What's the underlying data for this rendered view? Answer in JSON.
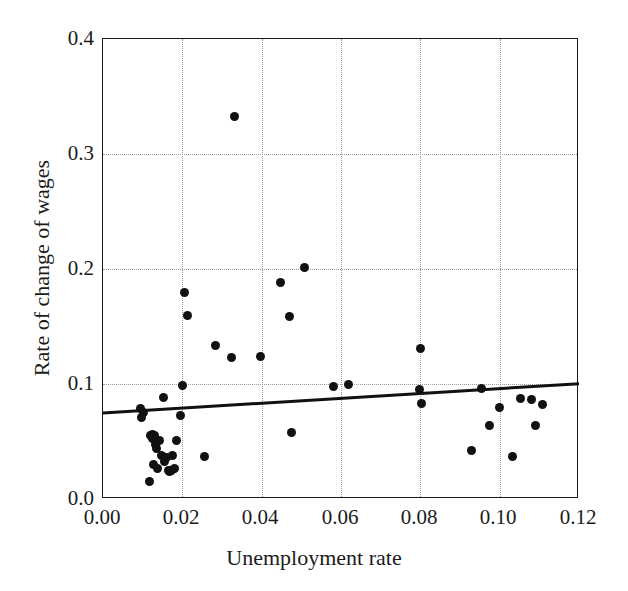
{
  "chart_data": {
    "type": "scatter",
    "title": "",
    "xlabel": "Unemployment rate",
    "ylabel": "Rate of change of wages",
    "xlim": [
      0.0,
      0.12
    ],
    "ylim": [
      0.0,
      0.4
    ],
    "xticks": [
      0.0,
      0.02,
      0.04,
      0.06,
      0.08,
      0.1,
      0.12
    ],
    "yticks": [
      0.0,
      0.1,
      0.2,
      0.3,
      0.4
    ],
    "xticklabels": [
      "0.00",
      "0.02",
      "0.04",
      "0.06",
      "0.08",
      "0.10",
      "0.12"
    ],
    "yticklabels": [
      "0.0",
      "0.1",
      "0.2",
      "0.3",
      "0.4"
    ],
    "grid": true,
    "grid_style": "dotted",
    "grid_color": "#9a9a9a",
    "legend": null,
    "marker_color": "#111111",
    "marker_size_px": 9,
    "series": [
      {
        "name": "observations",
        "points": [
          [
            0.0095,
            0.079
          ],
          [
            0.0098,
            0.0713
          ],
          [
            0.0103,
            0.0752
          ],
          [
            0.0118,
            0.0148
          ],
          [
            0.012,
            0.0553
          ],
          [
            0.0124,
            0.0565
          ],
          [
            0.0126,
            0.053
          ],
          [
            0.0128,
            0.0298
          ],
          [
            0.0131,
            0.0548
          ],
          [
            0.0133,
            0.047
          ],
          [
            0.0136,
            0.0443
          ],
          [
            0.0138,
            0.0265
          ],
          [
            0.0142,
            0.0513
          ],
          [
            0.0147,
            0.0378
          ],
          [
            0.0152,
            0.0885
          ],
          [
            0.0155,
            0.033
          ],
          [
            0.016,
            0.0357
          ],
          [
            0.0164,
            0.0248
          ],
          [
            0.0168,
            0.0243
          ],
          [
            0.0172,
            0.0252
          ],
          [
            0.0176,
            0.0382
          ],
          [
            0.0179,
            0.0265
          ],
          [
            0.0186,
            0.0508
          ],
          [
            0.0196,
            0.0723
          ],
          [
            0.02,
            0.0987
          ],
          [
            0.0205,
            0.1795
          ],
          [
            0.0212,
            0.1597
          ],
          [
            0.0255,
            0.0367
          ],
          [
            0.0283,
            0.1337
          ],
          [
            0.0325,
            0.1232
          ],
          [
            0.0332,
            0.333
          ],
          [
            0.0396,
            0.124
          ],
          [
            0.0448,
            0.188
          ],
          [
            0.047,
            0.159
          ],
          [
            0.0475,
            0.0582
          ],
          [
            0.0508,
            0.201
          ],
          [
            0.058,
            0.0978
          ],
          [
            0.062,
            0.1
          ],
          [
            0.0798,
            0.095
          ],
          [
            0.08,
            0.1305
          ],
          [
            0.0803,
            0.0828
          ],
          [
            0.093,
            0.042
          ],
          [
            0.0955,
            0.0963
          ],
          [
            0.0975,
            0.064
          ],
          [
            0.1,
            0.0795
          ],
          [
            0.1033,
            0.0372
          ],
          [
            0.1052,
            0.0872
          ],
          [
            0.108,
            0.0868
          ],
          [
            0.109,
            0.064
          ],
          [
            0.1108,
            0.082
          ]
        ]
      }
    ],
    "trend_line": {
      "name": "fitted regression line",
      "x": [
        0.0,
        0.12
      ],
      "y": [
        0.0748,
        0.1003
      ],
      "color": "#111111",
      "width_px": 3
    }
  }
}
